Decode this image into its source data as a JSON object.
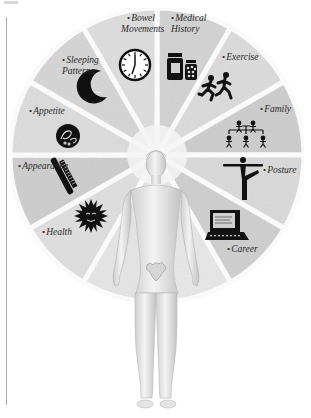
{
  "diagram": {
    "title": "",
    "center_figure": "standing human figure (statue) at hub of wheel",
    "colors": {
      "segment_dark": "#c9c9c9",
      "segment_mid": "#d6d6d6",
      "segment_light": "#e4e4e4",
      "segment_blank": "#eeeeee",
      "gap": "#ffffff",
      "text": "#2a2a2a",
      "icon": "#111111",
      "frame_line": "#a8a8a8"
    },
    "bullet": "•",
    "segments": [
      {
        "id": "medical-history",
        "label": "Medical History",
        "lines": [
          "Medical",
          "History"
        ],
        "icon": "medicine-bottles-icon"
      },
      {
        "id": "exercise",
        "label": "Exercise",
        "lines": [
          "Exercise"
        ],
        "icon": "runners-icon"
      },
      {
        "id": "family",
        "label": "Family",
        "lines": [
          "Family"
        ],
        "icon": "family-tree-icon"
      },
      {
        "id": "posture",
        "label": "Posture",
        "lines": [
          "Posture"
        ],
        "icon": "balance-pose-icon"
      },
      {
        "id": "career",
        "label": "Career",
        "lines": [
          "Career"
        ],
        "icon": "computer-icon"
      },
      {
        "id": "blank-1",
        "label": "",
        "lines": [],
        "icon": ""
      },
      {
        "id": "blank-2",
        "label": "",
        "lines": [],
        "icon": ""
      },
      {
        "id": "health",
        "label": "Health",
        "lines": [
          "Health"
        ],
        "icon": "sun-face-icon"
      },
      {
        "id": "appearance",
        "label": "Appearance",
        "lines": [
          "Appearance"
        ],
        "icon": "comb-icon"
      },
      {
        "id": "appetite",
        "label": "Appetite",
        "lines": [
          "Appetite"
        ],
        "icon": "food-plate-icon"
      },
      {
        "id": "sleeping-patterns",
        "label": "Sleeping Patterns",
        "lines": [
          "Sleeping",
          "Patterns"
        ],
        "icon": "moon-star-icon"
      },
      {
        "id": "bowel-movements",
        "label": "Bowel Movements",
        "lines": [
          "Bowel",
          "Movements"
        ],
        "icon": "clock-icon"
      }
    ]
  }
}
